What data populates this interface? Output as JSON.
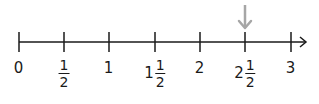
{
  "number_line": {
    "axis_y": 42,
    "start_x": 19,
    "end_x": 306,
    "tick_top": 32,
    "tick_bottom": 52,
    "line_color": "#1a1a1a",
    "ticks": [
      {
        "value": 0,
        "x": 19,
        "label": {
          "whole": "0",
          "num": "",
          "den": ""
        }
      },
      {
        "value": 0.5,
        "x": 64,
        "label": {
          "whole": "",
          "num": "1",
          "den": "2"
        }
      },
      {
        "value": 1,
        "x": 109,
        "label": {
          "whole": "1",
          "num": "",
          "den": ""
        }
      },
      {
        "value": 1.5,
        "x": 155,
        "label": {
          "whole": "1",
          "num": "1",
          "den": "2"
        }
      },
      {
        "value": 2,
        "x": 200,
        "label": {
          "whole": "2",
          "num": "",
          "den": ""
        }
      },
      {
        "value": 2.5,
        "x": 245,
        "label": {
          "whole": "2",
          "num": "1",
          "den": "2"
        }
      },
      {
        "value": 3,
        "x": 291,
        "label": {
          "whole": "3",
          "num": "",
          "den": ""
        }
      }
    ],
    "marker": {
      "value": 2.5,
      "x": 245,
      "type": "down-arrow",
      "color": "#a6a6a6",
      "top": 5,
      "bottom": 28
    }
  }
}
